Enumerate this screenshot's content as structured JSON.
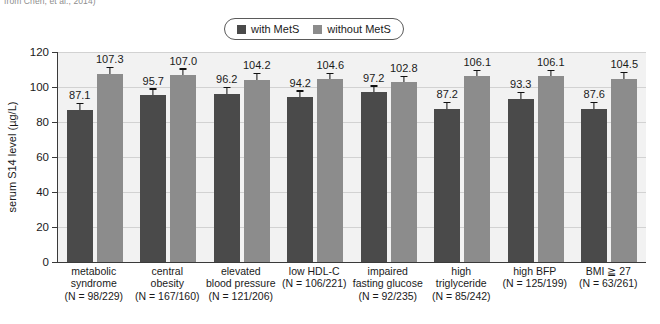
{
  "citation": "from Chen, et al., 2014)",
  "legend": {
    "entries": [
      {
        "label": "with MetS",
        "color": "#4a4a4a"
      },
      {
        "label": "without MetS",
        "color": "#8c8c8c"
      }
    ]
  },
  "axis": {
    "y_title": "serum S14 level (µg/L)",
    "y_ticks": [
      "0",
      "20",
      "40",
      "60",
      "80",
      "100",
      "120"
    ]
  },
  "chart_data": {
    "type": "bar",
    "title": "",
    "xlabel": "",
    "ylabel": "serum S14 level (µg/L)",
    "ylim": [
      0,
      120
    ],
    "ytick_values": [
      0,
      20,
      40,
      60,
      80,
      100,
      120
    ],
    "grid": true,
    "legend_position": "top-center",
    "categories": [
      "metabolic syndrome",
      "central obesity",
      "elevated blood pressure",
      "low HDL-C",
      "impaired fasting glucose",
      "high triglyceride",
      "high BFP",
      "BMI ≧ 27"
    ],
    "category_lines": [
      [
        "metabolic",
        "syndrome",
        "(N = 98/229)"
      ],
      [
        "central",
        "obesity",
        "(N = 167/160)"
      ],
      [
        "elevated",
        "blood pressure",
        "(N = 121/206)"
      ],
      [
        "low HDL-C",
        "(N = 106/221)"
      ],
      [
        "impaired",
        "fasting glucose",
        "(N = 92/235)"
      ],
      [
        "high",
        "triglyceride",
        "(N = 85/242)"
      ],
      [
        "high BFP",
        "(N = 125/199)"
      ],
      [
        "BMI ≧ 27",
        "(N = 63/261)"
      ]
    ],
    "sample_sizes": [
      "(N = 98/229)",
      "(N = 167/160)",
      "(N = 121/206)",
      "(N = 106/221)",
      "(N = 92/235)",
      "(N = 85/242)",
      "(N = 125/199)",
      "(N = 63/261)"
    ],
    "series": [
      {
        "name": "with MetS",
        "color": "#4a4a4a",
        "values": [
          87.1,
          95.7,
          96.2,
          94.2,
          97.2,
          87.2,
          93.3,
          87.6
        ],
        "errors": [
          3.2,
          2.8,
          3.0,
          3.2,
          3.0,
          3.4,
          3.2,
          3.4
        ]
      },
      {
        "name": "without MetS",
        "color": "#8c8c8c",
        "values": [
          107.3,
          107.0,
          104.2,
          104.6,
          102.8,
          106.1,
          106.1,
          104.5
        ],
        "errors": [
          3.4,
          3.0,
          3.0,
          3.0,
          2.8,
          3.2,
          3.2,
          3.4
        ]
      }
    ]
  }
}
